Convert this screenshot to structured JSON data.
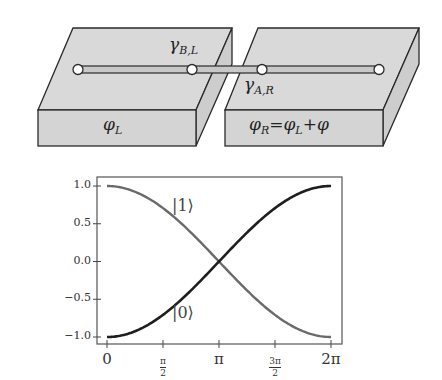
{
  "diagram": {
    "left_slab": {
      "label": "φ_L",
      "label_main": "φ",
      "label_sub": "L"
    },
    "right_slab": {
      "label": "φ_R = φ_L + φ",
      "label_main": "φ",
      "label_sub": "R",
      "eq": "=",
      "rhs_main": "φ",
      "rhs_sub": "L",
      "plus": "+",
      "rhs_tail": "φ"
    },
    "wire_nodes": 4,
    "majorana_labels": [
      {
        "id": "gamma_BL",
        "main": "γ",
        "sub": "B,L"
      },
      {
        "id": "gamma_AR",
        "main": "γ",
        "sub": "A,R"
      }
    ],
    "colors": {
      "slab_fill": "#d9d9d9",
      "slab_side": "#cfcfcf",
      "edge": "#2a2a2a",
      "wire": "#c8c8c8",
      "node": "#ffffff"
    }
  },
  "chart_data": {
    "type": "line",
    "title": "",
    "xlabel": "",
    "ylabel": "",
    "xlim": [
      0,
      6.2832
    ],
    "ylim": [
      -1.05,
      1.05
    ],
    "grid": false,
    "x_ticks": [
      {
        "value": 0,
        "label": "0"
      },
      {
        "value": 1.5708,
        "label": "π/2",
        "num": "π",
        "den": "2"
      },
      {
        "value": 3.1416,
        "label": "π"
      },
      {
        "value": 4.7124,
        "label": "3π/2",
        "num": "3π",
        "den": "2"
      },
      {
        "value": 6.2832,
        "label": "2π"
      }
    ],
    "y_ticks": [
      {
        "value": 1.0,
        "label": "1.0"
      },
      {
        "value": 0.5,
        "label": "0.5"
      },
      {
        "value": 0.0,
        "label": "0.0"
      },
      {
        "value": -0.5,
        "label": "−0.5"
      },
      {
        "value": -1.0,
        "label": "−1.0"
      }
    ],
    "x": [
      0,
      0.7854,
      1.5708,
      2.3562,
      3.1416,
      3.927,
      4.7124,
      5.4978,
      6.2832
    ],
    "series": [
      {
        "name": "|1⟩",
        "label_text": "|1⟩",
        "color": "#6a6a6a",
        "values": [
          1.0,
          0.924,
          0.707,
          0.383,
          0.0,
          -0.383,
          -0.707,
          -0.924,
          -1.0
        ],
        "formula": "cos(φ/2)"
      },
      {
        "name": "|0⟩",
        "label_text": "|0⟩",
        "color": "#1e1e1e",
        "values": [
          -1.0,
          -0.924,
          -0.707,
          -0.383,
          0.0,
          0.383,
          0.707,
          0.924,
          1.0
        ],
        "formula": "-cos(φ/2)"
      }
    ],
    "annotations": [
      {
        "text": "|1⟩",
        "x": 2.3,
        "y": 0.72
      },
      {
        "text": "|0⟩",
        "x": 2.3,
        "y": -0.74
      }
    ]
  }
}
